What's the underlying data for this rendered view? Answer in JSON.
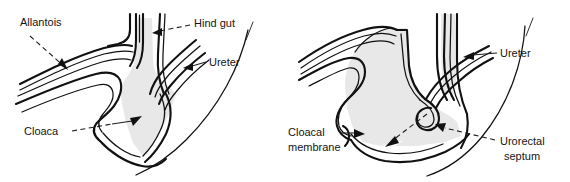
{
  "figure": {
    "panel_count": 2,
    "style": {
      "line_color": "#111111",
      "cavity_fill": "#e8e8e8",
      "background": "#ffffff",
      "label_color": "#141414"
    }
  },
  "panels": [
    {
      "id": "panel-left",
      "name": "early-cloaca-stage",
      "labels": [
        {
          "key": "allantois",
          "text": "Allantois",
          "x": 20,
          "y": 26,
          "leader": "dashed-arrow"
        },
        {
          "key": "hind_gut",
          "text": "Hind gut",
          "x": 194,
          "y": 27,
          "leader": "dashed-arrow"
        },
        {
          "key": "ureter",
          "text": "Ureter",
          "x": 209,
          "y": 66,
          "leader": "solid-arrow"
        },
        {
          "key": "cloaca",
          "text": "Cloaca",
          "x": 24,
          "y": 135,
          "leader": "dashed-arrow"
        }
      ]
    },
    {
      "id": "panel-right",
      "name": "urorectal-septum-stage",
      "labels": [
        {
          "key": "ureter",
          "text": "Ureter",
          "x": 215,
          "y": 57,
          "leader": "solid-arrow"
        },
        {
          "key": "cloacal_membrane_line1",
          "text": "Cloacal",
          "x": 3,
          "y": 136,
          "leader": "solid-arrow"
        },
        {
          "key": "cloacal_membrane_line2",
          "text": "membrane",
          "x": 3,
          "y": 151,
          "leader": "none"
        },
        {
          "key": "urorectal_septum_line1",
          "text": "Urorectal",
          "x": 215,
          "y": 145,
          "leader": "dashed-arrow"
        },
        {
          "key": "urorectal_septum_line2",
          "text": "septum",
          "x": 219,
          "y": 160,
          "leader": "none"
        }
      ]
    }
  ]
}
